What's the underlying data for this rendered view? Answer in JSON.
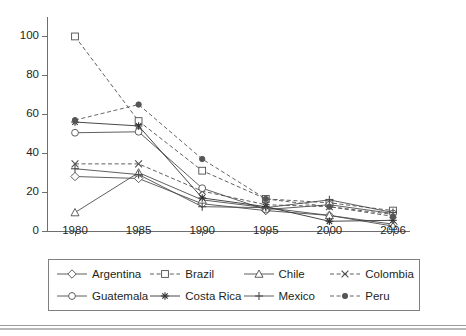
{
  "chart_data": {
    "type": "line",
    "title": "",
    "subtitle": "",
    "xlabel": "",
    "ylabel": "",
    "x": [
      "1980",
      "1985",
      "1990",
      "1995",
      "2000",
      "2006"
    ],
    "xtick_labels": [
      "1980",
      "1985",
      "1990",
      "1995",
      "2000",
      "2006"
    ],
    "ytick_labels": [
      "0",
      "20",
      "40",
      "60",
      "80",
      "100"
    ],
    "yticks": [
      0,
      20,
      40,
      60,
      80,
      100
    ],
    "ylim": [
      0,
      110
    ],
    "grid": false,
    "legend_position": "bottom",
    "legend_columns": 4,
    "series": [
      {
        "name": "Argentina",
        "marker": "diamond",
        "marker_fill": "open",
        "linestyle": "solid",
        "color": "#4d4d4d",
        "values": [
          28,
          27,
          14,
          10.5,
          8,
          3.5
        ]
      },
      {
        "name": "Brazil",
        "marker": "square",
        "marker_fill": "open",
        "linestyle": "dashed",
        "color": "#4d4d4d",
        "values": [
          100,
          56.5,
          31,
          16.5,
          14.5,
          10.5
        ]
      },
      {
        "name": "Chile",
        "marker": "triangle",
        "marker_fill": "open",
        "linestyle": "solid",
        "color": "#4d4d4d",
        "values": [
          9.5,
          30,
          16,
          12,
          8,
          2.5
        ]
      },
      {
        "name": "Colombia",
        "marker": "cross-x",
        "marker_fill": "open",
        "linestyle": "dashed",
        "color": "#4d4d4d",
        "values": [
          34.5,
          34.5,
          20.5,
          13.5,
          12.5,
          8.5
        ]
      },
      {
        "name": "Guatemala",
        "marker": "circle",
        "marker_fill": "open",
        "linestyle": "solid",
        "color": "#4d4d4d",
        "values": [
          50.5,
          51,
          22,
          11,
          13.5,
          9
        ]
      },
      {
        "name": "Costa Rica",
        "marker": "asterisk",
        "marker_fill": "filled",
        "linestyle": "solid",
        "color": "#333333",
        "values": [
          56,
          54,
          17,
          12.5,
          5,
          5.5
        ]
      },
      {
        "name": "Mexico",
        "marker": "plus",
        "marker_fill": "filled",
        "linestyle": "solid",
        "color": "#4d4d4d",
        "values": [
          32,
          29,
          12.5,
          12,
          16,
          9.5
        ]
      },
      {
        "name": "Peru",
        "marker": "filled-circle",
        "marker_fill": "filled",
        "linestyle": "dashed",
        "color": "#555555",
        "values": [
          57,
          65,
          37,
          16.5,
          12.5,
          7.5
        ]
      }
    ]
  },
  "legend": {
    "items": [
      {
        "label": "Argentina"
      },
      {
        "label": "Brazil"
      },
      {
        "label": "Chile"
      },
      {
        "label": "Colombia"
      },
      {
        "label": "Guatemala"
      },
      {
        "label": "Costa Rica"
      },
      {
        "label": "Mexico"
      },
      {
        "label": "Peru"
      }
    ]
  },
  "colors": {
    "axis": "#6f6f6f",
    "text": "#231f20",
    "legend_border": "#808080",
    "background": "#ffffff"
  }
}
